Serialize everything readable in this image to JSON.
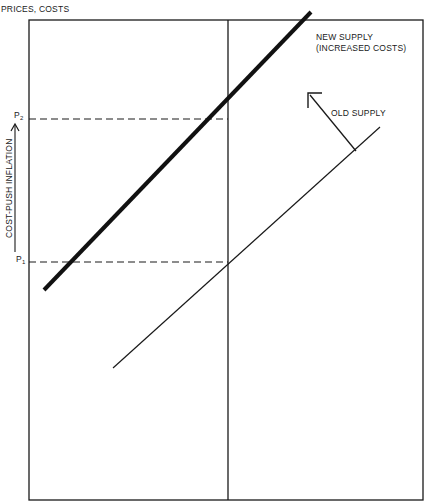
{
  "diagram": {
    "y_axis_label": "PRICES, COSTS",
    "curves": {
      "new_supply": {
        "label_line1": "NEW SUPPLY",
        "label_line2": "(INCREASED COSTS)"
      },
      "old_supply": {
        "label": "OLD SUPPLY"
      }
    },
    "price_levels": {
      "p2": {
        "letter": "P",
        "sub": "2"
      },
      "p1": {
        "letter": "P",
        "sub": "1"
      }
    },
    "side_annotation": "COST-PUSH INFLATION",
    "colors": {
      "ink": "#1a1a1a",
      "background": "#ffffff"
    }
  }
}
